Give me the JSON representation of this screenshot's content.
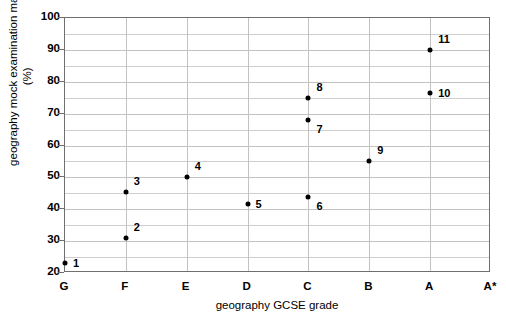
{
  "chart_data": {
    "type": "scatter",
    "title": "",
    "xlabel": "geography GCSE grade",
    "ylabel_line1": "geography mock examination mark",
    "ylabel_line2": "(%)",
    "categories": [
      "G",
      "F",
      "E",
      "D",
      "C",
      "B",
      "A",
      "A*"
    ],
    "ylim": [
      20,
      100
    ],
    "yticks": [
      20,
      30,
      40,
      50,
      60,
      70,
      80,
      90,
      100
    ],
    "ytick_labels": [
      "20",
      "30",
      "40",
      "50",
      "60",
      "70",
      "80",
      "90",
      "100"
    ],
    "minor_y_step": 5,
    "grid": true,
    "legend": "none",
    "point_color": "#000000",
    "gridline_color": "#c2c2c2",
    "axis_color": "#6f6f6f",
    "points": [
      {
        "label": "1",
        "grade": "G",
        "x_index": 0,
        "y": 23,
        "label_side": "right"
      },
      {
        "label": "2",
        "grade": "F",
        "x_index": 1,
        "y": 31,
        "label_side": "upper-right"
      },
      {
        "label": "3",
        "grade": "F",
        "x_index": 1,
        "y": 45.5,
        "label_side": "upper-right"
      },
      {
        "label": "4",
        "grade": "E",
        "x_index": 2,
        "y": 50,
        "label_side": "upper-right"
      },
      {
        "label": "5",
        "grade": "D",
        "x_index": 3,
        "y": 41.5,
        "label_side": "right"
      },
      {
        "label": "6",
        "grade": "C",
        "x_index": 4,
        "y": 44,
        "label_side": "lower-right"
      },
      {
        "label": "7",
        "grade": "C",
        "x_index": 4,
        "y": 68,
        "label_side": "lower-right"
      },
      {
        "label": "8",
        "grade": "C",
        "x_index": 4,
        "y": 75,
        "label_side": "upper-right"
      },
      {
        "label": "9",
        "grade": "B",
        "x_index": 5,
        "y": 55,
        "label_side": "upper-right"
      },
      {
        "label": "10",
        "grade": "A",
        "x_index": 6,
        "y": 76.5,
        "label_side": "right"
      },
      {
        "label": "11",
        "grade": "A",
        "x_index": 6,
        "y": 90,
        "label_side": "upper-right"
      }
    ]
  }
}
